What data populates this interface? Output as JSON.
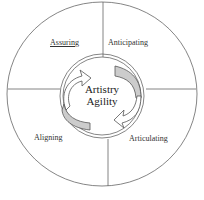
{
  "diagram": {
    "quadrants": [
      {
        "id": "assuring",
        "label": "Assuring",
        "underlined": true
      },
      {
        "id": "anticipating",
        "label": "Anticipating"
      },
      {
        "id": "aligning",
        "label": "Aligning"
      },
      {
        "id": "articulating",
        "label": "Articulating"
      }
    ],
    "center": {
      "line1": "Artistry",
      "line2": "Agility"
    },
    "colors": {
      "stroke": "#555555",
      "arrow_fill": "#cccccc"
    }
  }
}
